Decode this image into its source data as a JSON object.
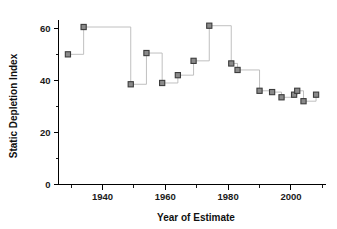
{
  "chart_data": {
    "type": "scatter",
    "title": "",
    "xlabel": "Year of Estimate",
    "ylabel": "Static Depletion Index",
    "xlim": [
      1926,
      2011
    ],
    "ylim": [
      0,
      63
    ],
    "grid": false,
    "legend": null,
    "x_major_ticks": [
      1940,
      1960,
      1980,
      2000
    ],
    "x_major_tick_labels": [
      "1940",
      "1960",
      "1980",
      "2000"
    ],
    "x_minor_ticks": [
      1930,
      1950,
      1970,
      1990,
      2010
    ],
    "y_major_ticks": [
      0,
      20,
      40,
      60
    ],
    "y_major_tick_labels": [
      "0",
      "20",
      "40",
      "60"
    ],
    "y_minor_ticks": [
      10,
      30,
      50
    ],
    "marker_style": "square",
    "marker_fill": "#8a8a8a",
    "marker_edge": "#3c3c3c",
    "line_style": "step-post",
    "line_color": "#b9b9b9",
    "x": [
      1929,
      1934,
      1949,
      1954,
      1959,
      1964,
      1969,
      1974,
      1981,
      1983,
      1990,
      1994,
      1997,
      2001,
      2002,
      2004,
      2008
    ],
    "values": [
      50.0,
      60.5,
      38.5,
      50.5,
      39.0,
      42.0,
      47.5,
      61.0,
      46.5,
      44.0,
      36.0,
      35.5,
      33.5,
      34.5,
      36.0,
      32.0,
      34.5
    ],
    "points": [
      {
        "x": 1929,
        "y": 50.0
      },
      {
        "x": 1934,
        "y": 60.5
      },
      {
        "x": 1949,
        "y": 38.5
      },
      {
        "x": 1954,
        "y": 50.5
      },
      {
        "x": 1959,
        "y": 39.0
      },
      {
        "x": 1964,
        "y": 42.0
      },
      {
        "x": 1969,
        "y": 47.5
      },
      {
        "x": 1974,
        "y": 61.0
      },
      {
        "x": 1981,
        "y": 46.5
      },
      {
        "x": 1983,
        "y": 44.0
      },
      {
        "x": 1990,
        "y": 36.0
      },
      {
        "x": 1994,
        "y": 35.5
      },
      {
        "x": 1997,
        "y": 33.5
      },
      {
        "x": 2001,
        "y": 34.5
      },
      {
        "x": 2002,
        "y": 36.0
      },
      {
        "x": 2004,
        "y": 32.0
      },
      {
        "x": 2008,
        "y": 34.5
      }
    ]
  }
}
